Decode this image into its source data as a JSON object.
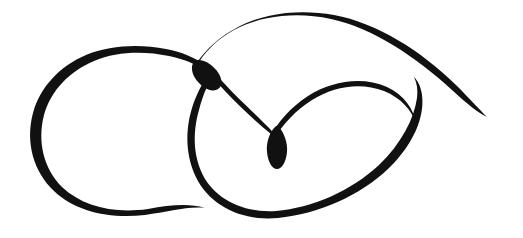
{
  "canvas": {
    "width": 523,
    "height": 238,
    "background_color": "#ffffff",
    "title": "Calligraphic Flourish Ornament"
  },
  "artwork": {
    "type": "calligraphic-flourish",
    "description": "A single continuous ornamental pen stroke forming a double-loop figure-eight style flourish with a tapered teardrop terminal and a long sweeping tail",
    "ink_color": "#111111",
    "stroke_style": "variable-width-brush",
    "medium": "pen-and-ink",
    "strokes": [
      {
        "name": "left-loop",
        "description": "Large oval loop on the left; thick at the top arc, tapering to a fine point at its lower-right terminal",
        "fill_color": "#111111",
        "max_thickness_px": 12,
        "min_thickness_px": 2,
        "leftmost_x": 31,
        "top_arc_apex": [
          125,
          62
        ],
        "bottom_y": 212,
        "terminal_point": [
          205,
          208
        ]
      },
      {
        "name": "crossing-node",
        "description": "Dense junction where the left loop, the big right loop and the top arc overlap",
        "fill_color": "#111111",
        "center": [
          205,
          73
        ],
        "thickness_px": 15
      },
      {
        "name": "big-right-loop",
        "description": "Large loop on the right side; thick near the upper-left, thinning to a hairline along the bottom sweep",
        "fill_color": "#111111",
        "max_thickness_px": 12,
        "min_thickness_px": 3,
        "leftmost_x": 188,
        "rightmost_x": 424,
        "bottom_y": 217
      },
      {
        "name": "inner-spiral",
        "description": "Inner curl rising from the teardrop, arcing over to the right and joining the big loop",
        "fill_color": "#111111",
        "max_thickness_px": 9,
        "apex": [
          345,
          82
        ]
      },
      {
        "name": "teardrop-terminal",
        "description": "Bulbous teardrop blob where the inner spiral terminates",
        "fill_color": "#111111",
        "center": [
          278,
          146
        ],
        "width_px": 16,
        "height_px": 27
      },
      {
        "name": "top-sweep-tail",
        "description": "Long top arc rising from the crossing node, sweeping right and tapering to a needle point at the lower right",
        "fill_color": "#111111",
        "max_thickness_px": 14,
        "apex_y": 20,
        "terminal_point": [
          487,
          117
        ]
      }
    ],
    "bounding_box": {
      "x": 31,
      "y": 14,
      "width": 456,
      "height": 204
    }
  }
}
